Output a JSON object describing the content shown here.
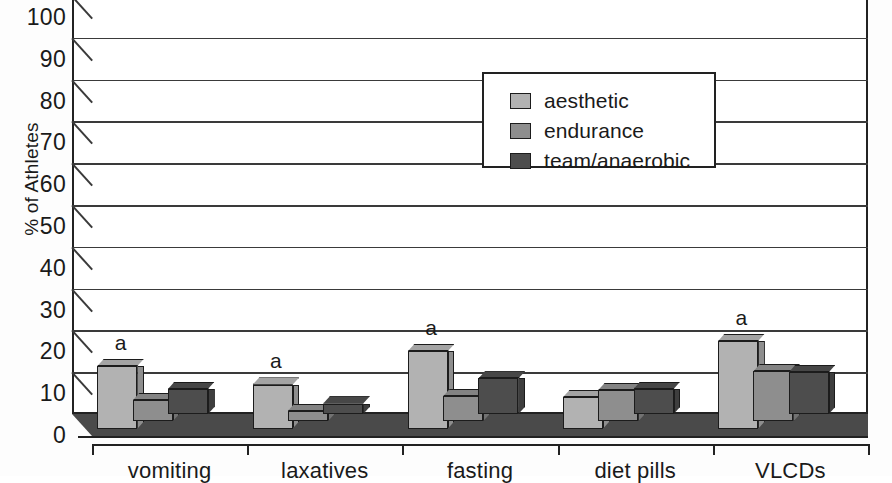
{
  "chart_data": {
    "type": "bar",
    "title": "",
    "xlabel": "",
    "ylabel": "% of Athletes",
    "ylim": [
      0,
      100
    ],
    "yticks": [
      0,
      10,
      20,
      30,
      40,
      50,
      60,
      70,
      80,
      90,
      100
    ],
    "grid": true,
    "legend_position": "upper center",
    "categories": [
      "vomiting",
      "laxatives",
      "fasting",
      "diet pills",
      "VLCDs"
    ],
    "series": [
      {
        "name": "aesthetic",
        "color": "#b2b2b2",
        "values": [
          15,
          10.5,
          18.5,
          7.5,
          21
        ]
      },
      {
        "name": "endurance",
        "color": "#8e8e8e",
        "values": [
          5,
          2.5,
          6,
          7.5,
          12
        ]
      },
      {
        "name": "team/anaerobic",
        "color": "#4d4d4d",
        "values": [
          6,
          2.5,
          8.5,
          6,
          10
        ]
      }
    ],
    "annotations": [
      {
        "category": "vomiting",
        "series": "aesthetic",
        "text": "a"
      },
      {
        "category": "laxatives",
        "series": "aesthetic",
        "text": "a"
      },
      {
        "category": "fasting",
        "series": "aesthetic",
        "text": "a"
      },
      {
        "category": "VLCDs",
        "series": "aesthetic",
        "text": "a"
      }
    ]
  },
  "axis": {
    "y_title": "% of Athletes",
    "y_tick_labels": [
      "100",
      "90",
      "80",
      "70",
      "60",
      "50",
      "40",
      "30",
      "20",
      "10",
      "0"
    ],
    "x_tick_labels": [
      "vomiting",
      "laxatives",
      "fasting",
      "diet pills",
      "VLCDs"
    ]
  },
  "legend": {
    "items": [
      {
        "label": "aesthetic",
        "color": "#b2b2b2"
      },
      {
        "label": "endurance",
        "color": "#8e8e8e"
      },
      {
        "label": "team/anaerobic",
        "color": "#4d4d4d"
      }
    ]
  },
  "colors": {
    "aesthetic": "#b2b2b2",
    "endurance": "#8e8e8e",
    "team_anaerobic": "#4d4d4d",
    "axis": "#222222",
    "floor": "#4a4a4a",
    "background": "#ffffff"
  }
}
